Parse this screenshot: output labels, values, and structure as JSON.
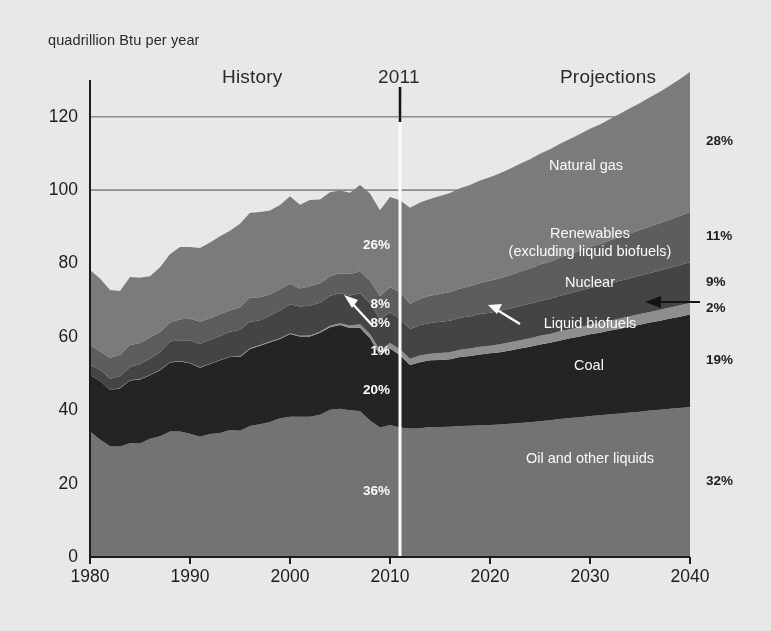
{
  "axis_unit": "quadrillion Btu per year",
  "eras": {
    "history": "History",
    "divider_year": "2011",
    "projections": "Projections"
  },
  "chart_data": {
    "type": "area",
    "title": "",
    "subtitle": "",
    "xlabel": "",
    "ylabel": "quadrillion Btu per year",
    "ylim": [
      0,
      130
    ],
    "xlim": [
      1980,
      2040
    ],
    "yticks": [
      0,
      20,
      40,
      60,
      80,
      100,
      120
    ],
    "xticks": [
      1980,
      1990,
      2000,
      2010,
      2020,
      2030,
      2040
    ],
    "gridlines": [
      "100",
      "120"
    ],
    "grid": true,
    "legend_position": "inline-labels",
    "stacked": true,
    "divider_x": 2011,
    "annotations": [
      {
        "text": "History",
        "x": 1995
      },
      {
        "text": "2011",
        "x": 2011
      },
      {
        "text": "Projections",
        "x": 2028
      }
    ],
    "x": [
      1980,
      1981,
      1982,
      1983,
      1984,
      1985,
      1986,
      1987,
      1988,
      1989,
      1990,
      1991,
      1992,
      1993,
      1994,
      1995,
      1996,
      1997,
      1998,
      1999,
      2000,
      2001,
      2002,
      2003,
      2004,
      2005,
      2006,
      2007,
      2008,
      2009,
      2010,
      2011,
      2012,
      2013,
      2014,
      2015,
      2016,
      2017,
      2018,
      2019,
      2020,
      2021,
      2022,
      2023,
      2024,
      2025,
      2026,
      2027,
      2028,
      2029,
      2030,
      2031,
      2032,
      2033,
      2034,
      2035,
      2036,
      2037,
      2038,
      2039,
      2040
    ],
    "series": [
      {
        "name": "Oil and other liquids",
        "color": "#757575",
        "share_2011": "36%",
        "share_2040": "32%",
        "values": [
          34.2,
          32.0,
          30.2,
          30.1,
          31.0,
          30.9,
          32.2,
          32.9,
          34.2,
          34.2,
          33.6,
          32.8,
          33.5,
          33.8,
          34.6,
          34.4,
          35.7,
          36.2,
          36.8,
          37.8,
          38.2,
          38.2,
          38.2,
          38.8,
          40.1,
          40.4,
          40.0,
          39.8,
          37.2,
          35.3,
          36.0,
          35.3,
          35.0,
          35.1,
          35.4,
          35.4,
          35.5,
          35.7,
          35.8,
          35.9,
          36.0,
          36.1,
          36.3,
          36.5,
          36.7,
          37.0,
          37.3,
          37.6,
          37.9,
          38.1,
          38.4,
          38.6,
          38.9,
          39.1,
          39.4,
          39.6,
          39.9,
          40.1,
          40.4,
          40.6,
          40.9
        ]
      },
      {
        "name": "Coal",
        "color": "#242424",
        "share_2011": "20%",
        "share_2040": "19%",
        "values": [
          15.4,
          16.0,
          15.3,
          15.9,
          17.1,
          17.5,
          17.3,
          18.0,
          18.8,
          19.1,
          19.2,
          18.8,
          19.1,
          19.8,
          19.9,
          20.1,
          21.0,
          21.4,
          21.7,
          21.6,
          22.6,
          21.9,
          21.9,
          22.3,
          22.5,
          22.8,
          22.4,
          22.7,
          22.4,
          19.7,
          20.8,
          19.7,
          17.3,
          18.0,
          18.2,
          18.3,
          18.4,
          18.8,
          19.0,
          19.3,
          19.5,
          19.7,
          20.0,
          20.3,
          20.6,
          20.9,
          21.1,
          21.4,
          21.7,
          22.0,
          22.3,
          22.5,
          22.8,
          23.1,
          23.4,
          23.7,
          24.0,
          24.3,
          24.6,
          24.9,
          25.2
        ]
      },
      {
        "name": "Liquid biofuels",
        "color": "#909090",
        "share_2011": "1%",
        "share_2040": "2%",
        "values": [
          0.0,
          0.0,
          0.0,
          0.1,
          0.1,
          0.1,
          0.1,
          0.1,
          0.1,
          0.1,
          0.1,
          0.1,
          0.1,
          0.1,
          0.1,
          0.2,
          0.2,
          0.2,
          0.2,
          0.2,
          0.2,
          0.2,
          0.3,
          0.3,
          0.4,
          0.5,
          0.7,
          0.9,
          1.2,
          1.3,
          1.5,
          1.6,
          1.7,
          1.8,
          1.8,
          1.9,
          1.9,
          2.0,
          2.0,
          2.1,
          2.1,
          2.2,
          2.2,
          2.3,
          2.3,
          2.4,
          2.4,
          2.5,
          2.5,
          2.6,
          2.6,
          2.7,
          2.7,
          2.8,
          2.8,
          2.9,
          2.9,
          3.0,
          3.0,
          3.1,
          3.1
        ]
      },
      {
        "name": "Nuclear",
        "color": "#454545",
        "share_2011": "8%",
        "share_2040": "9%",
        "values": [
          2.7,
          3.0,
          3.1,
          3.2,
          3.6,
          4.1,
          4.4,
          4.9,
          5.6,
          5.7,
          6.1,
          6.4,
          6.5,
          6.5,
          6.8,
          7.2,
          7.2,
          6.7,
          7.1,
          7.6,
          7.9,
          8.0,
          8.1,
          7.9,
          8.2,
          8.2,
          8.2,
          8.5,
          8.4,
          8.4,
          8.4,
          8.3,
          8.1,
          8.3,
          8.4,
          8.5,
          8.6,
          8.7,
          8.8,
          8.9,
          9.0,
          9.1,
          9.2,
          9.3,
          9.4,
          9.5,
          9.6,
          9.7,
          9.8,
          9.9,
          10.0,
          10.1,
          10.2,
          10.3,
          10.4,
          10.5,
          10.6,
          10.7,
          10.8,
          11.0,
          11.1
        ]
      },
      {
        "name": "Renewables (excluding liquid biofuels)",
        "color": "#5e5e5e",
        "share_2011": "8%",
        "share_2040": "11%",
        "values": [
          5.5,
          5.0,
          5.7,
          5.8,
          6.0,
          5.7,
          5.8,
          5.4,
          5.2,
          5.7,
          5.9,
          6.0,
          5.8,
          6.0,
          5.8,
          6.2,
          6.6,
          6.3,
          5.8,
          5.8,
          5.6,
          4.9,
          5.3,
          5.3,
          5.3,
          5.4,
          5.8,
          5.9,
          6.1,
          6.4,
          6.8,
          7.3,
          6.9,
          7.2,
          7.4,
          7.6,
          7.8,
          8.0,
          8.2,
          8.5,
          8.7,
          8.9,
          9.1,
          9.4,
          9.6,
          9.9,
          10.1,
          10.4,
          10.6,
          10.9,
          11.2,
          11.4,
          11.7,
          11.9,
          12.2,
          12.4,
          12.7,
          12.9,
          13.2,
          13.4,
          13.7
        ]
      },
      {
        "name": "Natural gas",
        "color": "#7d7d7d",
        "share_2011": "26%",
        "share_2040": "28%",
        "values": [
          20.4,
          19.9,
          18.5,
          17.4,
          18.5,
          17.8,
          16.7,
          17.7,
          18.6,
          19.7,
          19.6,
          20.1,
          20.7,
          21.2,
          21.7,
          22.7,
          23.1,
          23.2,
          22.8,
          22.9,
          23.8,
          22.8,
          23.5,
          22.8,
          22.9,
          22.6,
          22.2,
          23.6,
          23.8,
          23.4,
          24.6,
          25.0,
          26.2,
          26.2,
          26.4,
          26.7,
          27.0,
          27.3,
          27.6,
          27.9,
          28.2,
          28.6,
          29.0,
          29.4,
          29.8,
          30.2,
          30.6,
          31.0,
          31.4,
          31.8,
          32.2,
          32.6,
          33.1,
          33.6,
          34.1,
          34.6,
          35.2,
          35.8,
          36.5,
          37.3,
          38.2
        ]
      }
    ],
    "right_shares": [
      "28%",
      "11%",
      "9%",
      "2%",
      "19%",
      "32%"
    ],
    "left_shares": [
      "26%",
      "8%",
      "8%",
      "1%",
      "20%",
      "36%"
    ]
  },
  "inline_labels": {
    "natural_gas": "Natural gas",
    "renewables_line1": "Renewables",
    "renewables_line2": "(excluding liquid biofuels)",
    "nuclear": "Nuclear",
    "liquid_biofuels": "Liquid biofuels",
    "coal": "Coal",
    "oil": "Oil and other liquids"
  },
  "colors": {
    "background": "#ececeb",
    "axis": "#1d1d1d",
    "divider": "#ffffff",
    "gridline": "#8e8e8e"
  }
}
